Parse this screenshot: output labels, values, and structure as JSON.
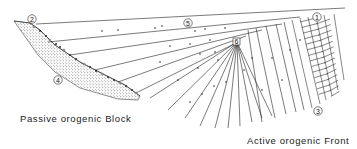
{
  "diagram": {
    "colors": {
      "ink": "#1a1a1a",
      "background": "#ffffff"
    },
    "captions": {
      "passive": "Passive orogenic Block",
      "active": "Active orogenic Front"
    },
    "markers": [
      {
        "id": "1",
        "label": "1",
        "meaning": "active front top"
      },
      {
        "id": "2",
        "label": "2",
        "meaning": "passive block top"
      },
      {
        "id": "3",
        "label": "3",
        "meaning": "imbricate thrust zone"
      },
      {
        "id": "4",
        "label": "4",
        "meaning": "stippled passive block"
      },
      {
        "id": "5",
        "label": "5",
        "meaning": "basin fill layers"
      },
      {
        "id": "6",
        "label": "6",
        "meaning": "fan convergence point"
      }
    ],
    "elements": [
      "passive-block-wedge",
      "basin-fill-layers",
      "sediment-fan",
      "imbricate-thrust-zone",
      "pebble-markers"
    ]
  }
}
